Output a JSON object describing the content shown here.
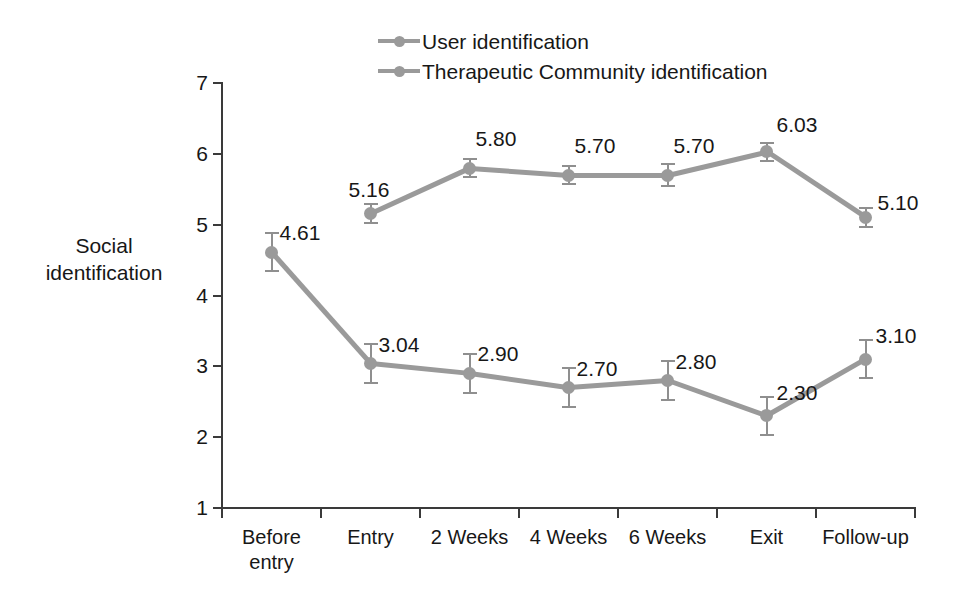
{
  "chart_data": {
    "type": "line",
    "title": "",
    "xlabel": "",
    "ylabel": "Social identification",
    "ylabel_lines": [
      "Social",
      "identification"
    ],
    "categories": [
      "Before entry",
      "Entry",
      "2 Weeks",
      "4 Weeks",
      "6 Weeks",
      "Exit",
      "Follow-up"
    ],
    "category_lines": [
      [
        "Before",
        "entry"
      ],
      [
        "Entry"
      ],
      [
        "2 Weeks"
      ],
      [
        "4 Weeks"
      ],
      [
        "6 Weeks"
      ],
      [
        "Exit"
      ],
      [
        "Follow-up"
      ]
    ],
    "ylim": [
      1,
      7
    ],
    "yticks": [
      1,
      2,
      3,
      4,
      5,
      6,
      7
    ],
    "ytick_labels": [
      "1",
      "2",
      "3",
      "4",
      "5",
      "6",
      "7"
    ],
    "grid": false,
    "legend_position": "top-center",
    "series": [
      {
        "name": "User identification",
        "color": "#9a9a9a",
        "marker": "circle",
        "values": [
          4.61,
          3.04,
          2.9,
          2.7,
          2.8,
          2.3,
          3.1
        ],
        "value_labels": [
          "4.61",
          "3.04",
          "2.90",
          "2.70",
          "2.80",
          "2.30",
          "3.10"
        ],
        "errors": [
          0.27,
          0.27,
          0.27,
          0.27,
          0.27,
          0.27,
          0.27
        ]
      },
      {
        "name": "Therapeutic Community identification",
        "color": "#9a9a9a",
        "marker": "circle",
        "values": [
          null,
          5.16,
          5.8,
          5.7,
          5.7,
          6.03,
          5.1
        ],
        "value_labels": [
          null,
          "5.16",
          "5.80",
          "5.70",
          "5.70",
          "6.03",
          "5.10"
        ],
        "errors": [
          null,
          0.13,
          0.13,
          0.13,
          0.15,
          0.13,
          0.13
        ]
      }
    ]
  },
  "legend": {
    "items": [
      {
        "label": "User identification"
      },
      {
        "label": "Therapeutic Community identification"
      }
    ]
  }
}
